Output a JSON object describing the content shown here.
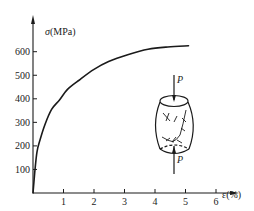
{
  "chart_data": {
    "type": "line",
    "title": "",
    "xlabel": "ε(%)",
    "ylabel": "σ(MPa)",
    "xlim": [
      0,
      6.7
    ],
    "ylim": [
      0,
      700
    ],
    "grid": false,
    "legend": null,
    "x_ticks": [
      1,
      2,
      3,
      4,
      5,
      6
    ],
    "y_ticks": [
      100,
      200,
      300,
      400,
      500,
      600
    ],
    "series": [
      {
        "name": "stress-strain (compression)",
        "x": [
          0,
          0.06,
          0.13,
          0.23,
          0.39,
          0.61,
          0.87,
          1.13,
          1.52,
          2.0,
          2.48,
          3.13,
          3.77,
          4.42,
          5.1
        ],
        "y": [
          0,
          90,
          175,
          225,
          290,
          355,
          395,
          440,
          480,
          525,
          558,
          588,
          610,
          620,
          625
        ]
      }
    ],
    "annotations": [
      {
        "type": "inset-drawing",
        "description": "barrel-shaped compressed specimen with load arrows",
        "labels": [
          "P",
          "P"
        ]
      }
    ]
  },
  "axes": {
    "y_label_symbol": "σ",
    "y_label_unit": "(MPa)",
    "x_label_symbol": "ε",
    "x_label_unit": "(%)",
    "y_tick_labels": [
      "100",
      "200",
      "300",
      "400",
      "500",
      "600"
    ],
    "x_tick_labels": [
      "1",
      "2",
      "3",
      "4",
      "5",
      "6"
    ]
  },
  "inset": {
    "top_load_label": "P",
    "bottom_load_label": "P"
  },
  "colors": {
    "ink": "#1a1a1a",
    "background": "#ffffff"
  }
}
